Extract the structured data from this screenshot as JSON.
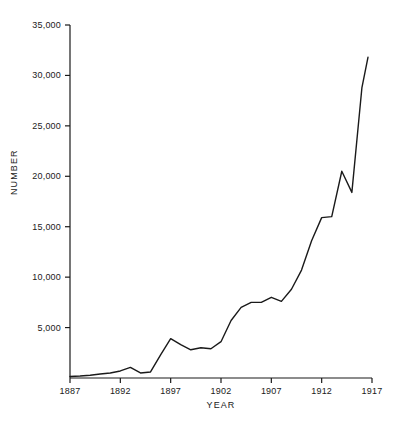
{
  "chart_data": {
    "type": "line",
    "title": "",
    "subtitle": "",
    "xlabel": "YEAR",
    "ylabel": "NUMBER",
    "xlim": [
      1887,
      1917
    ],
    "ylim": [
      0,
      35000
    ],
    "grid": false,
    "legend": null,
    "legend_position": "none",
    "xticks": [
      1887,
      1892,
      1897,
      1902,
      1907,
      1912,
      1917
    ],
    "xtick_labels": [
      "1887",
      "1892",
      "1897",
      "1902",
      "1907",
      "1912",
      "1917"
    ],
    "yticks": [
      5000,
      10000,
      15000,
      20000,
      25000,
      30000,
      35000
    ],
    "ytick_labels": [
      "5,000",
      "10,000",
      "15,000",
      "20,000",
      "25,000",
      "30,000",
      "35,000"
    ],
    "line_color": "#1a1a1a",
    "line_width": 1.4,
    "series": [
      {
        "name": "Number",
        "x": [
          1887,
          1888,
          1889,
          1890,
          1891,
          1892,
          1893,
          1894,
          1895,
          1896,
          1897,
          1898,
          1899,
          1900,
          1901,
          1902,
          1903,
          1904,
          1905,
          1906,
          1907,
          1908,
          1909,
          1910,
          1911,
          1912,
          1913,
          1914,
          1915,
          1916
        ],
        "values": [
          150,
          200,
          280,
          400,
          500,
          700,
          1050,
          500,
          600,
          2300,
          3900,
          3300,
          2800,
          3000,
          2900,
          3600,
          5700,
          7000,
          7500,
          7500,
          8000,
          7600,
          8800,
          10700,
          13600,
          15900,
          16000,
          20500,
          18400,
          28800
        ]
      }
    ],
    "annotations": [],
    "final_point": {
      "x": 1916.6,
      "y": 31800
    }
  },
  "axes": {
    "x_axis_name": "year-axis",
    "y_axis_name": "number-axis"
  }
}
